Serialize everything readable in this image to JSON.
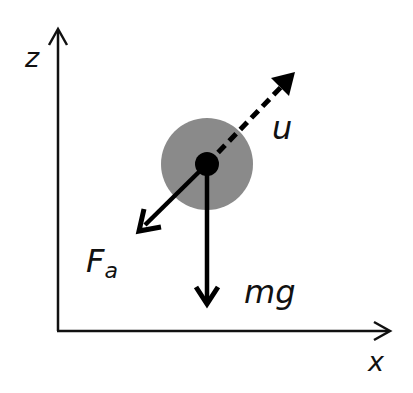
{
  "diagram": {
    "type": "free-body diagram",
    "axes": {
      "vertical_label": "z",
      "horizontal_label": "x"
    },
    "body": {
      "shape": "circle",
      "fill_color": "#8a8a8a",
      "center_dot_color": "#000000"
    },
    "vectors": [
      {
        "id": "velocity",
        "label": "u",
        "style": "dashed",
        "direction": "up-right"
      },
      {
        "id": "drag",
        "label": "F",
        "subscript": "a",
        "style": "solid",
        "direction": "down-left"
      },
      {
        "id": "gravity",
        "label": "mg",
        "style": "solid",
        "direction": "down"
      }
    ]
  }
}
